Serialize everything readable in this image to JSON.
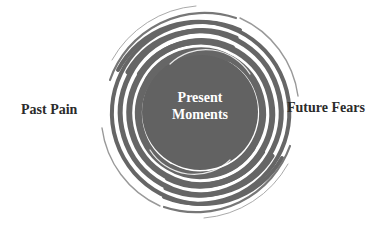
{
  "diagram": {
    "title": "",
    "center": {
      "line1": "Present",
      "line2": "Moments"
    },
    "left_label": "Past Pain",
    "right_label": "Future Fears",
    "colors": {
      "spiral": "#666666",
      "center_fill": "#616161",
      "side_text": "#2b2b2b",
      "center_text": "#ffffff",
      "background": "#ffffff"
    },
    "shape": "spiral-vortex"
  }
}
